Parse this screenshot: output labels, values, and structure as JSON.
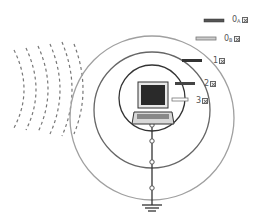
{
  "diagram": {
    "type": "shielding / grounding zones diagram",
    "center": {
      "x": 152,
      "y": 118
    },
    "rings": [
      {
        "id": "zone-3",
        "r": 33,
        "color": "#333333"
      },
      {
        "id": "zone-2",
        "r": 57,
        "color": "#555555"
      },
      {
        "id": "zone-1",
        "r": 82,
        "color": "#9a9a9a"
      }
    ],
    "device": "laptop",
    "ground_nodes_y": [
      125,
      152,
      172,
      198
    ],
    "ground_symbol_y": 205,
    "interference_waves": 5
  },
  "legend": [
    {
      "label": "0",
      "sub": "A",
      "swatch": "#555555",
      "style": "solid"
    },
    {
      "label": "0",
      "sub": "B",
      "swatch": "#aaaaaa",
      "style": "outline"
    },
    {
      "label": "1",
      "sub": "",
      "swatch": "#333333",
      "style": "solid"
    },
    {
      "label": "2",
      "sub": "",
      "swatch": "#444444",
      "style": "solid"
    },
    {
      "label": "3",
      "sub": "",
      "swatch": "#ffffff",
      "style": "outline"
    }
  ]
}
